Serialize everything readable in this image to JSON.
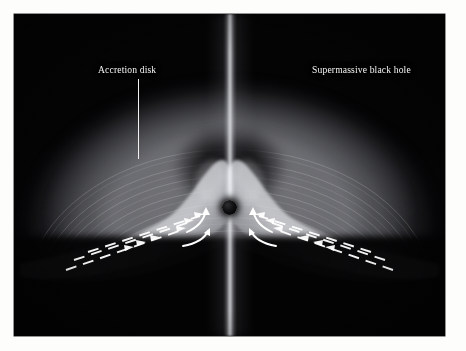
{
  "figure": {
    "type": "astronomical-illustration",
    "background_color": "#ffffff",
    "plate_color": "#050506",
    "accent_color": "#f4f4f2"
  },
  "annotations": [
    {
      "id": "accretion-disk",
      "label": "Accretion disk",
      "leader": "vertical",
      "points_to": "glowing disk halo"
    },
    {
      "id": "supermassive-black-hole",
      "label": "Supermassive black hole",
      "leader": "diagonal",
      "points_to": "central dark sphere"
    }
  ],
  "features": {
    "jet_label": "bipolar jet",
    "black_hole_label": "black hole",
    "inflow_label": "accretion inflow",
    "halo_label": "disk halo",
    "funnel_label": "funnel cavity"
  },
  "flow": {
    "left_direction": "inward up-right toward center",
    "right_direction": "inward up-left toward center",
    "arrow_color": "#ffffff"
  }
}
